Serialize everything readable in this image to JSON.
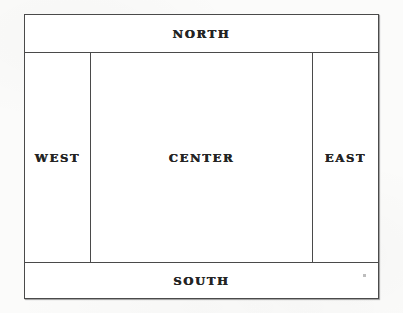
{
  "diagram": {
    "kind": "layout-manager-diagram",
    "border_color": "#4a4a4a",
    "background_color": "#ffffff",
    "page_background_color": "#fbfbfa",
    "label_color": "#232323",
    "regions": [
      {
        "id": "north",
        "label": "NORTH"
      },
      {
        "id": "west",
        "label": "WEST"
      },
      {
        "id": "center",
        "label": "CENTER"
      },
      {
        "id": "east",
        "label": "EAST"
      },
      {
        "id": "south",
        "label": "SOUTH"
      }
    ]
  }
}
